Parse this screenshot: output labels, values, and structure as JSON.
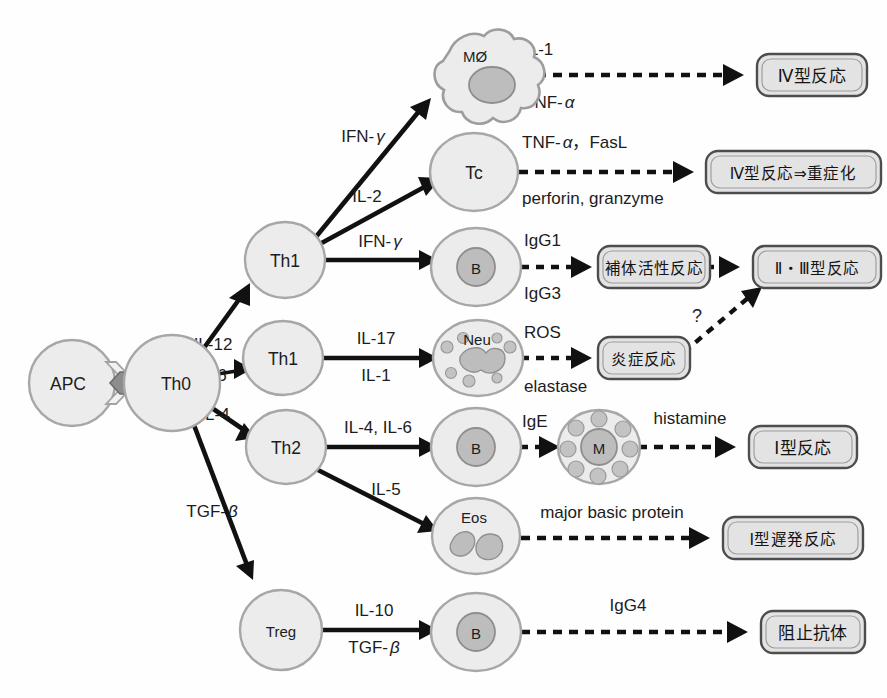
{
  "figure": {
    "background_color": "#fefefe",
    "ink_color": "#111111",
    "cell_fill": "#ececed",
    "cell_stroke": "#a7a7a8",
    "nucleus_fill": "#bdbdbe",
    "box_fill": "#e3e3e4",
    "box_stroke": "#4d4d4e"
  },
  "cells": {
    "apc": {
      "label": "APC",
      "type": "round-cell"
    },
    "th0": {
      "label": "Th0",
      "type": "round-cell"
    },
    "th1_upper": {
      "label": "Th1",
      "type": "round-cell"
    },
    "th1_lower": {
      "label": "Th1",
      "type": "round-cell"
    },
    "th2": {
      "label": "Th2",
      "type": "round-cell"
    },
    "treg": {
      "label": "Treg",
      "type": "round-cell"
    },
    "macrophage": {
      "label": "MØ",
      "type": "macrophage-cell"
    },
    "tc": {
      "label": "Tc",
      "type": "round-cell"
    },
    "b_cell_igg": {
      "label": "B",
      "type": "b-cell"
    },
    "neutrophil": {
      "label": "Neu",
      "type": "neutrophil-cell"
    },
    "b_cell_ige": {
      "label": "B",
      "type": "b-cell"
    },
    "mast_cell": {
      "label": "M",
      "type": "mast-cell"
    },
    "eosinophil": {
      "label": "Eos",
      "type": "eosinophil-cell"
    },
    "b_cell_igg4": {
      "label": "B",
      "type": "b-cell"
    }
  },
  "edges": {
    "th0_to_th1_upper": {
      "label": "IL-12",
      "style": "solid"
    },
    "th0_to_th1_lower": {
      "label": "IL-6",
      "style": "solid"
    },
    "th0_to_th2": {
      "label": "IL-4",
      "style": "solid"
    },
    "th0_to_treg": {
      "label": "TGF-β",
      "label_prefix": "TGF-",
      "label_greek": "β",
      "style": "solid"
    },
    "th1_to_macrophage": {
      "label": "IFN-γ",
      "label_prefix": "IFN-",
      "label_greek": "γ",
      "style": "solid"
    },
    "th1_to_tc": {
      "label": "IL-2",
      "style": "solid"
    },
    "th1_to_bcell": {
      "label": "IFN-γ",
      "label_prefix": "IFN-",
      "label_greek": "γ",
      "style": "solid"
    },
    "th1_lower_to_neu": {
      "label_top": "IL-17",
      "label_bottom": "IL-1",
      "style": "solid"
    },
    "th2_to_bcell": {
      "label": "IL-4, IL-6",
      "style": "solid"
    },
    "th2_to_eos": {
      "label": "IL-5",
      "style": "solid"
    },
    "treg_to_bcell": {
      "label_top": "IL-10",
      "label_bottom": "TGF-β",
      "bottom_prefix": "TGF-",
      "bottom_greek": "β",
      "style": "solid"
    },
    "macrophage_to_type4": {
      "label_top": "IL-1",
      "label_bottom": "TNF-α",
      "bottom_prefix": "TNF-",
      "bottom_greek": "α",
      "style": "dashed"
    },
    "tc_to_type4_severe": {
      "label_top": "TNF-α，FasL",
      "top_prefix": "TNF-",
      "top_greek": "α",
      "top_suffix": "，FasL",
      "label_bottom": "perforin, granzyme",
      "style": "dashed"
    },
    "bcell_to_complement": {
      "label_top": "IgG1",
      "label_bottom": "IgG3",
      "style": "dashed"
    },
    "complement_to_type23": {
      "label": "",
      "style": "dashed"
    },
    "neu_to_inflammation": {
      "label_top": "ROS",
      "label_bottom": "elastase",
      "style": "dashed"
    },
    "inflammation_to_type23": {
      "label": "?",
      "style": "dashed"
    },
    "bcell_to_mast": {
      "label": "IgE",
      "style": "dashed"
    },
    "mast_to_type1": {
      "label": "histamine",
      "style": "dashed"
    },
    "eos_to_type1_delayed": {
      "label": "major basic protein",
      "style": "dashed"
    },
    "bcell_to_blocking_ab": {
      "label": "IgG4",
      "style": "dashed"
    }
  },
  "outcomes": {
    "type4": {
      "label": "Ⅳ型反応"
    },
    "type4_severe": {
      "label": "Ⅳ型反応⇒重症化"
    },
    "complement": {
      "label": "補体活性反応"
    },
    "type23": {
      "label": "Ⅱ・Ⅲ型反応"
    },
    "inflammation": {
      "label": "炎症反応"
    },
    "type1": {
      "label": "Ⅰ型反応"
    },
    "type1_delayed": {
      "label": "Ⅰ型遅発反応"
    },
    "blocking_antibody": {
      "label": "阻止抗体"
    }
  }
}
